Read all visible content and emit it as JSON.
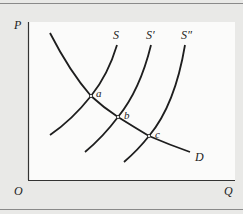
{
  "diagram": {
    "type": "supply-demand",
    "axes": {
      "y_label": "P",
      "x_label": "Q",
      "origin_label": "O"
    },
    "curves": [
      {
        "name": "D",
        "label": "D",
        "kind": "demand"
      },
      {
        "name": "S",
        "label": "S",
        "kind": "supply"
      },
      {
        "name": "S'",
        "label": "S′",
        "kind": "supply"
      },
      {
        "name": "S''",
        "label": "S″",
        "kind": "supply"
      }
    ],
    "points": [
      {
        "label": "a",
        "on": [
          "D",
          "S"
        ]
      },
      {
        "label": "b",
        "on": [
          "D",
          "S'"
        ]
      },
      {
        "label": "c",
        "on": [
          "D",
          "S''"
        ]
      }
    ],
    "colors": {
      "line": "#1e1e1e",
      "panel": "#fbfbfa",
      "background": "#e9e9e7"
    }
  }
}
